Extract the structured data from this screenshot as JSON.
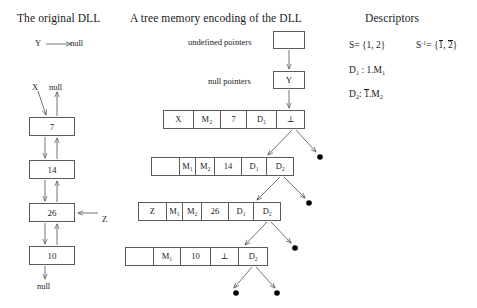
{
  "titles": {
    "left": "The original DLL",
    "middle": "A tree memory encoding of the DLL",
    "right": "Descriptors"
  },
  "left_panel": {
    "y_pointer": {
      "var": "Y",
      "target": "null"
    },
    "head_var": "X",
    "head_null": "null",
    "tail_null": "null",
    "z_var": "Z",
    "nodes": [
      {
        "value": "7"
      },
      {
        "value": "14"
      },
      {
        "value": "26"
      },
      {
        "value": "10"
      }
    ]
  },
  "middle_panel": {
    "undefined_pointers_label": "undefined pointers",
    "null_pointers_label": "null pointers",
    "undefined_box_value": "",
    "null_box_value": "Y",
    "rows": [
      {
        "cells": [
          "X",
          "M₂",
          "7",
          "D₁",
          "⊥"
        ]
      },
      {
        "cells": [
          "",
          "M₁",
          "M₂",
          "14",
          "D₁",
          "D₂"
        ]
      },
      {
        "cells": [
          "Z",
          "M₁",
          "M₂",
          "26",
          "D₁",
          "D₂"
        ]
      },
      {
        "cells": [
          "",
          "M₁",
          "10",
          "⊥",
          "D₂"
        ]
      }
    ]
  },
  "right_panel": {
    "lines": [
      {
        "left": "S = {1, 2}",
        "right": "S⁻¹ = {1̄, 2̄}"
      },
      {
        "left": "D₁ : 1.M₁",
        "right": ""
      },
      {
        "left": "D₂ : 1̄.M₂",
        "right": ""
      }
    ],
    "s_label": "S",
    "s_value": "= {1, 2}",
    "sinv_label": "S",
    "sinv_sup": "-1",
    "sinv_value": "= {",
    "sinv_a": "1",
    "sinv_sep": ", ",
    "sinv_b": "2",
    "sinv_close": "}",
    "d1_label": "D",
    "d1_sub": "1",
    "d1_value": ": 1.M",
    "d1_msub": "1",
    "d2_label": "D",
    "d2_sub": "2",
    "d2_colon": ":",
    "d2_bar": "1",
    "d2_value": ".M",
    "d2_msub": "2"
  },
  "colors": {
    "line": "#5a5a5a",
    "text": "#1a1a1a",
    "dot": "#000000"
  }
}
